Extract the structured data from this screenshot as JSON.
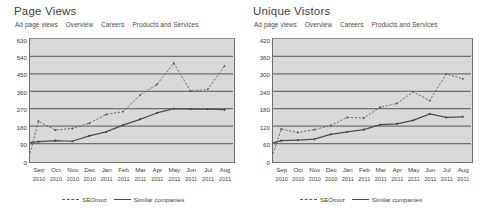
{
  "panels": [
    {
      "id": "page-views",
      "title": "Page Views",
      "nav": [
        "Ad page views",
        "Overview",
        "Careers",
        "Products and Services"
      ],
      "legend": [
        {
          "label": "SEOmoz",
          "style": "dashed"
        },
        {
          "label": "Similar companies",
          "style": "solid"
        }
      ]
    },
    {
      "id": "unique-visitors",
      "title": "Unique Vistors",
      "nav": [
        "Ad page views",
        "Overview",
        "Careers",
        "Products and Services"
      ],
      "legend": [
        {
          "label": "SEOmoz",
          "style": "dashed"
        },
        {
          "label": "Similar companies",
          "style": "solid"
        }
      ]
    }
  ],
  "chart_data": [
    {
      "type": "line",
      "title": "Page Views",
      "xlabel": "",
      "ylabel": "",
      "ylim": [
        0,
        630
      ],
      "yticks": [
        0,
        90,
        180,
        270,
        360,
        450,
        540,
        630
      ],
      "grid": true,
      "legend_position": "bottom",
      "categories": [
        "Sep",
        "Oct",
        "Nov",
        "Dec",
        "Jan",
        "Feb",
        "Mar",
        "Apr",
        "May",
        "Jun",
        "Jul",
        "Aug"
      ],
      "years": [
        "2010",
        "2010",
        "2010",
        "2010",
        "2011",
        "2011",
        "2011",
        "2011",
        "2011",
        "2011",
        "2011",
        "2011"
      ],
      "series": [
        {
          "name": "SEOmoz",
          "style": "dashed",
          "values": [
            40,
            205,
            160,
            168,
            195,
            240,
            255,
            340,
            395,
            505,
            360,
            370,
            490
          ]
        },
        {
          "name": "Similar companies",
          "style": "solid",
          "values": [
            95,
            100,
            105,
            102,
            130,
            150,
            185,
            215,
            248,
            270,
            268,
            268,
            265
          ]
        }
      ]
    },
    {
      "type": "line",
      "title": "Unique Vistors",
      "xlabel": "",
      "ylabel": "",
      "ylim": [
        0,
        420
      ],
      "yticks": [
        0,
        60,
        120,
        180,
        240,
        300,
        360,
        420
      ],
      "grid": true,
      "legend_position": "bottom",
      "categories": [
        "Sep",
        "Oct",
        "Nov",
        "Dec",
        "Jan",
        "Feb",
        "Mar",
        "Apr",
        "May",
        "Jun",
        "Jul",
        "Aug"
      ],
      "years": [
        "2010",
        "2010",
        "2010",
        "2010",
        "2011",
        "2011",
        "2011",
        "2011",
        "2011",
        "2011",
        "2011",
        "2011"
      ],
      "series": [
        {
          "name": "SEOmoz",
          "style": "dashed",
          "values": [
            25,
            110,
            98,
            108,
            122,
            150,
            148,
            185,
            198,
            238,
            208,
            300,
            283
          ]
        },
        {
          "name": "Similar companies",
          "style": "solid",
          "values": [
            62,
            70,
            72,
            75,
            92,
            100,
            108,
            125,
            128,
            140,
            162,
            150,
            152
          ]
        }
      ]
    }
  ]
}
